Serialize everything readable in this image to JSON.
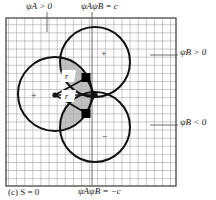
{
  "figure": {
    "caption": "(c) S = 0",
    "caption_parts": {
      "index": "(c)",
      "quantity": "S",
      "relation": "= 0"
    },
    "frame": {
      "x": 6,
      "y": 18,
      "width": 170,
      "height": 168,
      "grid_cell": 8.1,
      "grid_color": "#8a8a8a",
      "border_color": "#555555"
    }
  },
  "labels": {
    "top_left": {
      "text": "ψA > 0",
      "base": "ψ",
      "sub": "A",
      "rel": "> 0",
      "x": 28,
      "y": 4,
      "tick_x": 47,
      "tick_y1": 12,
      "tick_y2": 30
    },
    "top_right": {
      "text": "ψAψB = c",
      "base1": "ψ",
      "sub1": "A",
      "base2": "ψ",
      "sub2": "B",
      "rel": "= c",
      "x": 83,
      "y": 4,
      "tick_x": 92,
      "tick_y1": 12,
      "tick_y2": 186
    },
    "right_top": {
      "text": "ψB > 0",
      "base": "ψ",
      "sub": "B",
      "rel": "> 0",
      "x": 180,
      "y": 50,
      "line_x1": 150,
      "line_x2": 178,
      "line_y": 55
    },
    "right_bottom": {
      "text": "ψB < 0",
      "base": "ψ",
      "sub": "B",
      "rel": "< 0",
      "x": 180,
      "y": 120,
      "line_x1": 150,
      "line_x2": 178,
      "line_y": 125
    },
    "bottom": {
      "text": "ψAψB = −c",
      "base1": "ψ",
      "sub1": "A",
      "base2": "ψ",
      "sub2": "B",
      "rel": "= −c",
      "x": 80,
      "y": 188
    },
    "r_upper": {
      "text": "r",
      "x": 67,
      "y": 77
    },
    "r_lower": {
      "text": "r",
      "x": 67,
      "y": 96
    },
    "sign_plus_upper": {
      "text": "+",
      "x": 101,
      "y": 50
    },
    "sign_plus_left": {
      "text": "+",
      "x": 31,
      "y": 93
    },
    "sign_minus_lower": {
      "text": "−",
      "x": 102,
      "y": 133
    }
  },
  "geometry": {
    "circles": [
      {
        "name": "circle-left",
        "cx": 55,
        "cy": 94,
        "r": 37
      },
      {
        "name": "circle-upper",
        "cx": 95,
        "cy": 62,
        "r": 35
      },
      {
        "name": "circle-lower",
        "cx": 95,
        "cy": 127,
        "r": 35
      }
    ],
    "shaded_color": "#b8b8b8",
    "stroke_color": "#111111",
    "dots": [
      {
        "name": "dot-left",
        "cx": 55,
        "cy": 95,
        "r": 2.4
      },
      {
        "name": "dot-right",
        "cx": 95,
        "cy": 95,
        "r": 2.4
      }
    ],
    "squares": [
      {
        "name": "square-upper",
        "cx": 86,
        "cy": 77,
        "size": 8.5
      },
      {
        "name": "square-lower",
        "cx": 86,
        "cy": 114,
        "size": 8.5
      }
    ]
  }
}
